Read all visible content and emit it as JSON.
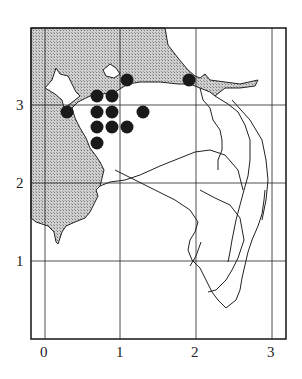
{
  "map": {
    "type": "grid distribution map",
    "x_ticks": [
      "0",
      "1",
      "2",
      "3"
    ],
    "y_ticks": [
      "1",
      "2",
      "3"
    ],
    "colors": {
      "land_shade": "#b8b8b8",
      "line": "#222222",
      "dot": "#1a1a1a",
      "background": "#ffffff"
    },
    "points": [
      {
        "x": 0.7,
        "y": 3.1
      },
      {
        "x": 0.9,
        "y": 3.1
      },
      {
        "x": 0.3,
        "y": 2.9
      },
      {
        "x": 0.7,
        "y": 2.9
      },
      {
        "x": 0.9,
        "y": 2.9
      },
      {
        "x": 1.3,
        "y": 2.9
      },
      {
        "x": 0.7,
        "y": 2.7
      },
      {
        "x": 0.9,
        "y": 2.7
      },
      {
        "x": 1.1,
        "y": 2.7
      },
      {
        "x": 0.7,
        "y": 2.5
      },
      {
        "x": 1.1,
        "y": 3.3
      },
      {
        "x": 1.9,
        "y": 3.3
      }
    ]
  }
}
